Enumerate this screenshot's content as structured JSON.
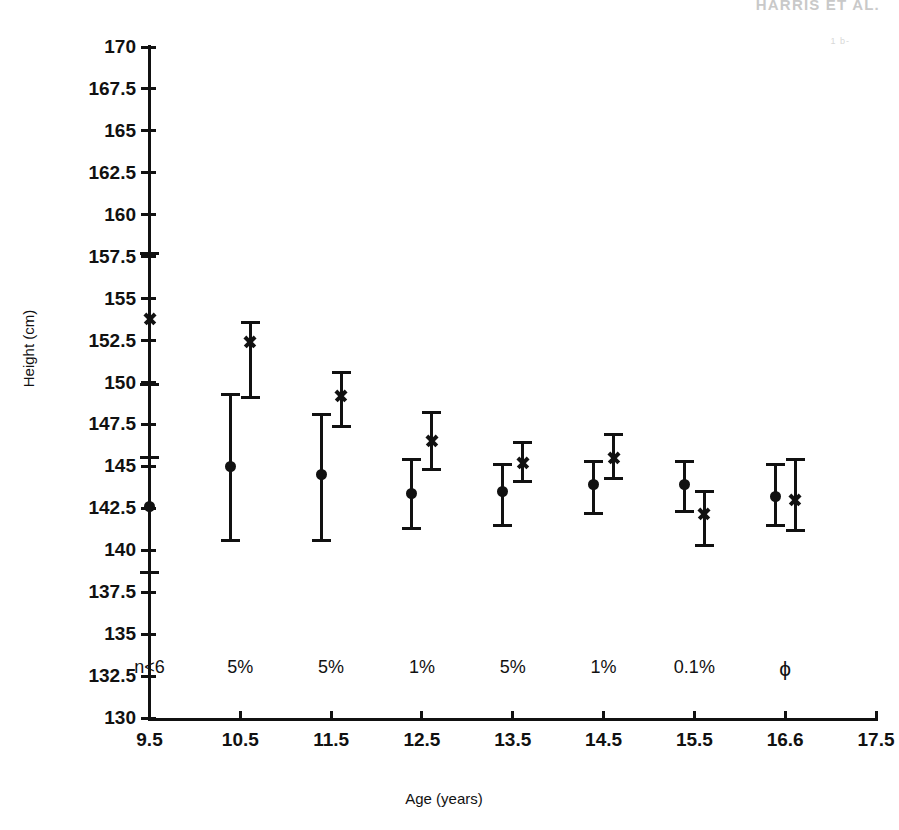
{
  "running_head": {
    "text": "HARRIS ET AL."
  },
  "page_speck": {
    "text": "1 b-"
  },
  "chart_data": {
    "type": "scatter",
    "title": "",
    "xlabel": "Age (years)",
    "ylabel": "Height (cm)",
    "xlim": [
      9.0,
      17.5
    ],
    "ylim": [
      130,
      170
    ],
    "grid": false,
    "legend_position": "none",
    "error_bars": "vertical, capped (mean with range/confidence limits)",
    "x_ticks": [
      "9.5",
      "10.5",
      "11.5",
      "12.5",
      "13.5",
      "14.5",
      "15.5",
      "16.6",
      "17.5"
    ],
    "x_tick_values": [
      9.5,
      10.5,
      11.5,
      12.5,
      13.5,
      14.5,
      15.5,
      16.6,
      17.5
    ],
    "y_ticks": [
      "170",
      "167.5",
      "165",
      "162.5",
      "160",
      "157.5",
      "155",
      "152.5",
      "150",
      "147.5",
      "145",
      "142.5",
      "140",
      "137.5",
      "135",
      "132.5",
      "130"
    ],
    "y_tick_values": [
      170,
      167.5,
      165,
      162.5,
      160,
      157.5,
      155,
      152.5,
      150,
      147.5,
      145,
      142.5,
      140,
      137.5,
      135,
      132.5,
      130
    ],
    "categories": [
      9.5,
      10.5,
      11.5,
      12.5,
      13.5,
      14.5,
      15.5,
      16.6
    ],
    "series": [
      {
        "name": "circle-marker-group",
        "marker": "filled-circle",
        "values": [
          142.6,
          145.0,
          144.5,
          143.4,
          143.5,
          143.9,
          143.9,
          143.2
        ],
        "lower": [
          138.7,
          140.6,
          140.6,
          141.3,
          141.5,
          142.2,
          142.3,
          141.5
        ],
        "upper": [
          145.5,
          149.3,
          148.1,
          145.4,
          145.1,
          145.3,
          145.3,
          145.1
        ]
      },
      {
        "name": "cross-marker-group",
        "marker": "cross",
        "values": [
          153.8,
          152.4,
          149.2,
          146.5,
          145.2,
          145.5,
          142.2,
          143.0
        ],
        "lower": [
          149.9,
          149.1,
          147.4,
          144.8,
          144.1,
          144.3,
          140.3,
          141.2
        ],
        "upper": [
          157.7,
          153.6,
          150.6,
          148.2,
          146.4,
          146.9,
          143.5,
          145.4
        ]
      }
    ],
    "annotations": [
      {
        "x": 9.5,
        "text": "n<6"
      },
      {
        "x": 10.5,
        "text": "5%"
      },
      {
        "x": 11.5,
        "text": "5%"
      },
      {
        "x": 12.5,
        "text": "1%"
      },
      {
        "x": 13.5,
        "text": "5%"
      },
      {
        "x": 14.5,
        "text": "1%"
      },
      {
        "x": 15.5,
        "text": "0.1%"
      },
      {
        "x": 16.6,
        "text": "ϕ"
      }
    ]
  }
}
